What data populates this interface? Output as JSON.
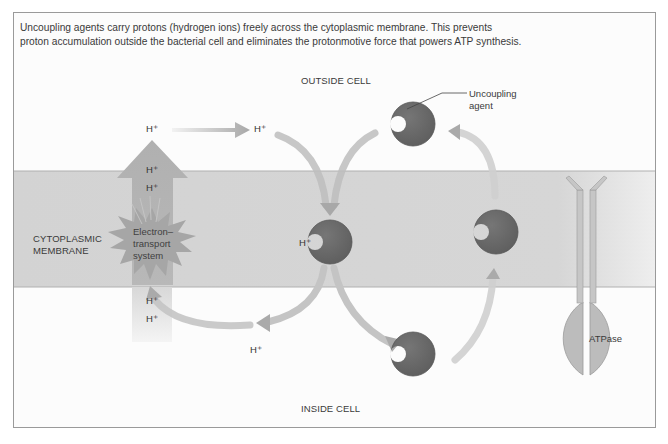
{
  "caption": {
    "line1": "Uncoupling agents carry protons (hydrogen ions) freely across the cytoplasmic membrane. This prevents",
    "line2": "proton accumulation outside the bacterial cell and eliminates the protonmotive force that powers ATP synthesis."
  },
  "regions": {
    "outside": "OUTSIDE CELL",
    "inside": "INSIDE CELL",
    "membrane_line1": "CYTOPLASMIC",
    "membrane_line2": "MEMBRANE"
  },
  "ets": {
    "line1": "Electron–",
    "line2": "transport",
    "line3": "system"
  },
  "uncoupler": {
    "label_line1": "Uncoupling",
    "label_line2": "agent"
  },
  "atpase": {
    "label": "ATPase"
  },
  "protons": {
    "top_left": "H⁺",
    "top_right": "H⁺",
    "arrow_up_1": "H⁺",
    "arrow_up_2": "H⁺",
    "inside_1": "H⁺",
    "inside_2": "H⁺",
    "bound": "H⁺",
    "bottom": "H⁺"
  },
  "colors": {
    "membrane": "#d6d6d6",
    "agent": "#6a6a6a",
    "arrow": "#b3b3b3",
    "atpase": "#b9b9b9"
  }
}
